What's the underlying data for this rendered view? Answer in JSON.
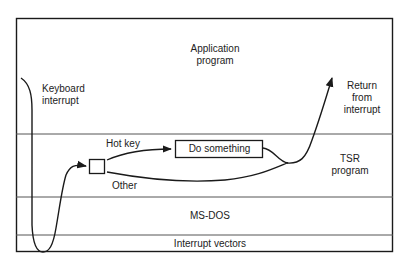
{
  "layers": [
    {
      "id": "application",
      "label_lines": [
        "Application",
        "program"
      ]
    },
    {
      "id": "tsr",
      "label_lines": [
        "TSR",
        "program"
      ]
    },
    {
      "id": "msdos",
      "label": "MS-DOS"
    },
    {
      "id": "vectors",
      "label": "Interrupt vectors"
    }
  ],
  "annotations": {
    "keyboard_interrupt": [
      "Keyboard",
      "interrupt"
    ],
    "return_from_interrupt": [
      "Return",
      "from",
      "interrupt"
    ],
    "hot_key": "Hot key",
    "other": "Other"
  },
  "boxes": {
    "do_something": "Do something"
  },
  "colors": {
    "line": "#1a1a1a",
    "separator": "#555555",
    "background": "#ffffff"
  }
}
